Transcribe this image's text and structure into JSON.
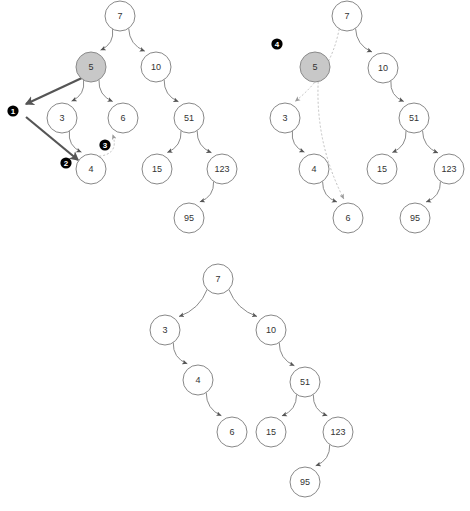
{
  "figure": {
    "type": "binary-search-tree-deletion-diagram",
    "background_color": "#ffffff",
    "node_fill": "#ffffff",
    "node_highlight_fill": "#c8c8c8",
    "node_stroke": "#888888",
    "edge_color": "#8a8a8a",
    "dashed_edge_color": "#c0c0c0",
    "thick_arrow_color": "#555555",
    "marker_fill": "#000000",
    "marker_text_color": "#ffffff",
    "node_radius": 15
  },
  "panels": [
    {
      "id": "panel-top-left",
      "name": "step-1-locate-node",
      "nodes": [
        {
          "id": "tl-7",
          "label": "7",
          "x": 120,
          "y": 16,
          "highlight": false
        },
        {
          "id": "tl-5",
          "label": "5",
          "x": 91,
          "y": 67,
          "highlight": true
        },
        {
          "id": "tl-10",
          "label": "10",
          "x": 156,
          "y": 67,
          "highlight": false
        },
        {
          "id": "tl-3",
          "label": "3",
          "x": 62,
          "y": 118,
          "highlight": false
        },
        {
          "id": "tl-6",
          "label": "6",
          "x": 123,
          "y": 118,
          "highlight": false
        },
        {
          "id": "tl-51",
          "label": "51",
          "x": 189,
          "y": 118,
          "highlight": false
        },
        {
          "id": "tl-4",
          "label": "4",
          "x": 91,
          "y": 169,
          "highlight": false
        },
        {
          "id": "tl-15",
          "label": "15",
          "x": 157,
          "y": 169,
          "highlight": false
        },
        {
          "id": "tl-123",
          "label": "123",
          "x": 222,
          "y": 169,
          "highlight": false
        },
        {
          "id": "tl-95",
          "label": "95",
          "x": 189,
          "y": 218,
          "highlight": false
        }
      ],
      "edges": [
        {
          "from": "tl-7",
          "to": "tl-5"
        },
        {
          "from": "tl-7",
          "to": "tl-10"
        },
        {
          "from": "tl-5",
          "to": "tl-3"
        },
        {
          "from": "tl-5",
          "to": "tl-6"
        },
        {
          "from": "tl-3",
          "to": "tl-4"
        },
        {
          "from": "tl-10",
          "to": "tl-51"
        },
        {
          "from": "tl-51",
          "to": "tl-15"
        },
        {
          "from": "tl-51",
          "to": "tl-123"
        },
        {
          "from": "tl-123",
          "to": "tl-95"
        }
      ],
      "dashed_edges": [
        {
          "from": "tl-4",
          "to": "tl-6"
        }
      ],
      "markers": [
        {
          "id": "marker-1",
          "label": "1",
          "x": 13,
          "y": 111
        },
        {
          "id": "marker-2",
          "label": "2",
          "x": 66,
          "y": 163
        },
        {
          "id": "marker-3",
          "label": "3",
          "x": 105,
          "y": 145
        }
      ]
    },
    {
      "id": "panel-top-right",
      "name": "step-4-relink-children",
      "nodes": [
        {
          "id": "tr-7",
          "label": "7",
          "x": 347,
          "y": 16,
          "highlight": false
        },
        {
          "id": "tr-5",
          "label": "5",
          "x": 315,
          "y": 67,
          "highlight": true
        },
        {
          "id": "tr-10",
          "label": "10",
          "x": 383,
          "y": 68,
          "highlight": false
        },
        {
          "id": "tr-3",
          "label": "3",
          "x": 285,
          "y": 118,
          "highlight": false
        },
        {
          "id": "tr-51",
          "label": "51",
          "x": 414,
          "y": 118,
          "highlight": false
        },
        {
          "id": "tr-4",
          "label": "4",
          "x": 314,
          "y": 169,
          "highlight": false
        },
        {
          "id": "tr-15",
          "label": "15",
          "x": 382,
          "y": 169,
          "highlight": false
        },
        {
          "id": "tr-123",
          "label": "123",
          "x": 449,
          "y": 169,
          "highlight": false
        },
        {
          "id": "tr-6",
          "label": "6",
          "x": 348,
          "y": 218,
          "highlight": false
        },
        {
          "id": "tr-95",
          "label": "95",
          "x": 415,
          "y": 218,
          "highlight": false
        }
      ],
      "edges": [
        {
          "from": "tr-7",
          "to": "tr-10"
        },
        {
          "from": "tr-3",
          "to": "tr-4"
        },
        {
          "from": "tr-4",
          "to": "tr-6"
        },
        {
          "from": "tr-10",
          "to": "tr-51"
        },
        {
          "from": "tr-51",
          "to": "tr-15"
        },
        {
          "from": "tr-51",
          "to": "tr-123"
        },
        {
          "from": "tr-123",
          "to": "tr-95"
        }
      ],
      "dashed_edges": [
        {
          "from": "tr-7",
          "to": "tr-3"
        },
        {
          "from": "tr-5",
          "to": "tr-6"
        }
      ],
      "markers": [
        {
          "id": "marker-4",
          "label": "4",
          "x": 277,
          "y": 44
        }
      ]
    },
    {
      "id": "panel-bottom",
      "name": "result-tree-after-deletion",
      "nodes": [
        {
          "id": "b-7",
          "label": "7",
          "x": 218,
          "y": 279,
          "highlight": false
        },
        {
          "id": "b-3",
          "label": "3",
          "x": 165,
          "y": 330,
          "highlight": false
        },
        {
          "id": "b-10",
          "label": "10",
          "x": 271,
          "y": 330,
          "highlight": false
        },
        {
          "id": "b-4",
          "label": "4",
          "x": 198,
          "y": 380,
          "highlight": false
        },
        {
          "id": "b-51",
          "label": "51",
          "x": 305,
          "y": 382,
          "highlight": false
        },
        {
          "id": "b-6",
          "label": "6",
          "x": 232,
          "y": 432,
          "highlight": false
        },
        {
          "id": "b-15",
          "label": "15",
          "x": 271,
          "y": 432,
          "highlight": false
        },
        {
          "id": "b-123",
          "label": "123",
          "x": 338,
          "y": 432,
          "highlight": false
        },
        {
          "id": "b-95",
          "label": "95",
          "x": 305,
          "y": 482,
          "highlight": false
        }
      ],
      "edges": [
        {
          "from": "b-7",
          "to": "b-3"
        },
        {
          "from": "b-7",
          "to": "b-10"
        },
        {
          "from": "b-3",
          "to": "b-4"
        },
        {
          "from": "b-4",
          "to": "b-6"
        },
        {
          "from": "b-10",
          "to": "b-51"
        },
        {
          "from": "b-51",
          "to": "b-15"
        },
        {
          "from": "b-51",
          "to": "b-123"
        },
        {
          "from": "b-123",
          "to": "b-95"
        }
      ],
      "dashed_edges": [],
      "markers": []
    }
  ],
  "thick_arrows": [
    {
      "id": "thick-arrow-1",
      "x1": 84,
      "y1": 77,
      "x2": 26,
      "y2": 104
    },
    {
      "id": "thick-arrow-2",
      "x1": 26,
      "y1": 117,
      "x2": 78,
      "y2": 160
    }
  ]
}
